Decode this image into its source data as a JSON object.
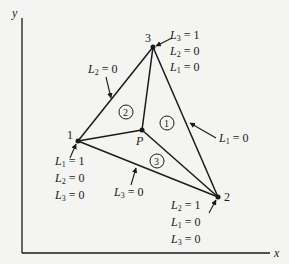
{
  "axes": {
    "x_label": "x",
    "y_label": "y"
  },
  "nodes": [
    {
      "id": "1",
      "label": "1",
      "x": 78,
      "y": 141
    },
    {
      "id": "2",
      "label": "2",
      "x": 218,
      "y": 197
    },
    {
      "id": "3",
      "label": "3",
      "x": 153,
      "y": 47
    },
    {
      "id": "P",
      "label": "P",
      "x": 142,
      "y": 130
    }
  ],
  "regions": [
    {
      "label": "1",
      "x": 165,
      "y": 123
    },
    {
      "label": "2",
      "x": 125,
      "y": 112
    },
    {
      "label": "3",
      "x": 158,
      "y": 161
    }
  ],
  "node3_coords": [
    "L3 = 1",
    "L2 = 0",
    "L1 = 0"
  ],
  "node1_coords": [
    "L1 = 1",
    "L2 = 0",
    "L3 = 0"
  ],
  "node2_coords": [
    "L2 = 1",
    "L1 = 0",
    "L3 = 0"
  ],
  "edge_labels": {
    "edge_13": "L2 = 0",
    "edge_32": "L1 = 0",
    "edge_12": "L3 = 0"
  },
  "text": {
    "y": "y",
    "x": "x",
    "n1": "1",
    "n2": "2",
    "n3": "3",
    "P": "P",
    "r1": "1",
    "r2": "2",
    "r3": "3",
    "L": "L",
    "eq1": " = 1",
    "eq0": " = 0",
    "s1": "1",
    "s2": "2",
    "s3": "3"
  }
}
